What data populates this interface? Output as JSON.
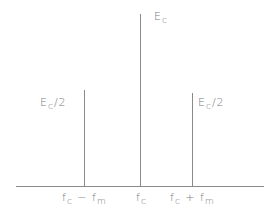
{
  "diagram": {
    "components": [
      {
        "id": "lower",
        "x_label": "f_c - f_m",
        "amplitude_label": "E_c/2",
        "x": 84,
        "top": 90
      },
      {
        "id": "carrier",
        "x_label": "f_c",
        "amplitude_label": "E_c",
        "x": 140,
        "top": 14
      },
      {
        "id": "upper",
        "x_label": "f_c + f_m",
        "amplitude_label": "E_c/2",
        "x": 192,
        "top": 93
      }
    ],
    "labels": {
      "carrier_amp": {
        "main": "E",
        "sub": "c",
        "suffix": ""
      },
      "lower_amp": {
        "main": "E",
        "sub": "c",
        "suffix": "/2"
      },
      "upper_amp": {
        "main": "E",
        "sub": "c",
        "suffix": "/2"
      },
      "x_lower": {
        "a": "f",
        "a_sub": "c",
        "op": " − ",
        "b": "f",
        "b_sub": "m"
      },
      "x_carrier": {
        "a": "f",
        "a_sub": "c"
      },
      "x_upper": {
        "a": "f",
        "a_sub": "c",
        "op": " + ",
        "b": "f",
        "b_sub": "m"
      }
    },
    "line_color": "#8a8a8a"
  }
}
